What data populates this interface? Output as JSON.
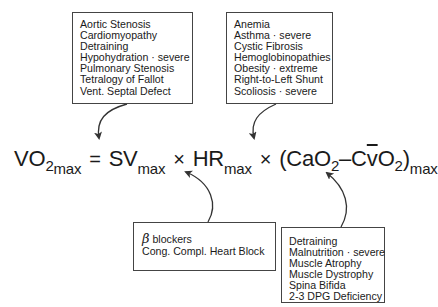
{
  "boxes": {
    "top_left": {
      "items": [
        "Aortic Stenosis",
        "Cardiomyopathy",
        "Detraining",
        "Hypohydration · severe",
        "Pulmonary Stenosis",
        "Tetralogy of Fallot",
        "Vent. Septal Defect"
      ]
    },
    "top_right": {
      "items": [
        "Anemia",
        "Asthma · severe",
        "Cystic Fibrosis",
        "Hemoglobinopathies",
        "Obesity · extreme",
        "Right-to-Left Shunt",
        "Scoliosis · severe"
      ]
    },
    "bottom_mid": {
      "beta_symbol": "β",
      "items": [
        "blockers",
        "Cong. Compl. Heart Block"
      ]
    },
    "bottom_right": {
      "items": [
        "Detraining",
        "Malnutrition · severe",
        "Muscle Atrophy",
        "Muscle Dystrophy",
        "Spina Bifida",
        "2-3 DPG Deficiency"
      ]
    }
  },
  "equation": {
    "vo2": "VO",
    "vo2_sub1": "2",
    "vo2_sub2": "max",
    "equals": "=",
    "sv": "SV",
    "sv_sub": "max",
    "times1": "×",
    "hr": "HR",
    "hr_sub": "max",
    "times2": "×",
    "open_paren": "(",
    "cao": "CaO",
    "cao_sub": "2",
    "minus": "–",
    "c": "C",
    "v_bar": "v",
    "o": "O",
    "cvo_sub": "2",
    "close_paren": ")",
    "diff_sub": "max"
  },
  "colors": {
    "border": "#444444",
    "arrow": "#333333",
    "text": "#1a1a1a"
  }
}
